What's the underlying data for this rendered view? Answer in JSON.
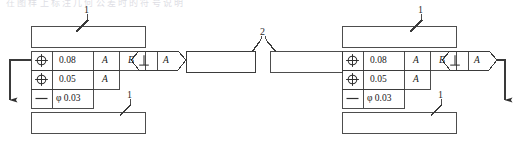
{
  "figure": {
    "line_color": "#333333",
    "text_color": "#171717",
    "background": "#ffffff"
  },
  "top_strip": {
    "clipped_text": "在图样上标注几何公差时的符号说明"
  },
  "symbols": {
    "position": "position-symbol",
    "straightness": "straightness-symbol",
    "perpendicularity": "perpendicularity-symbol",
    "diameter": "φ"
  },
  "left_assembly": {
    "callout_label_top": "1",
    "callout_label_bottom": "1",
    "upper_box": {
      "text": ""
    },
    "lower_box": {
      "text": ""
    },
    "control_frame": {
      "rows": [
        {
          "symbol": "position-symbol",
          "tolerance": "0.08",
          "datums": [
            "A",
            "B"
          ]
        },
        {
          "symbol": "position-symbol",
          "tolerance": "0.05",
          "datums": [
            "A"
          ]
        },
        {
          "symbol": "straightness-symbol",
          "tolerance": "φ 0.03",
          "datums": []
        }
      ]
    },
    "perpendicularity_frame": {
      "symbol": "perpendicularity-symbol",
      "datum": "A"
    },
    "attached_box": {
      "text": ""
    }
  },
  "right_assembly": {
    "callout_label_top": "1",
    "callout_label_bottom": "1",
    "upper_box": {
      "text": ""
    },
    "lower_box": {
      "text": ""
    },
    "control_frame": {
      "rows": [
        {
          "symbol": "position-symbol",
          "tolerance": "0.08",
          "datums": [
            "A",
            "B"
          ]
        },
        {
          "symbol": "position-symbol",
          "tolerance": "0.05",
          "datums": [
            "A"
          ]
        },
        {
          "symbol": "straightness-symbol",
          "tolerance": "φ 0.03",
          "datums": []
        }
      ]
    },
    "perpendicularity_frame": {
      "symbol": "perpendicularity-symbol",
      "datum": "A"
    },
    "attached_box": {
      "text": ""
    }
  },
  "center": {
    "callout_label": "2",
    "left_box": {
      "text": ""
    },
    "right_box": {
      "text": ""
    }
  }
}
